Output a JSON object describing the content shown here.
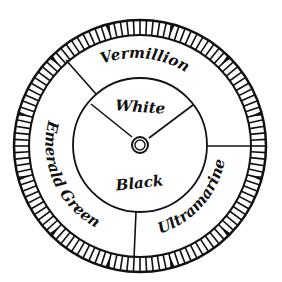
{
  "diagram": {
    "colors": {
      "ink": "#111111",
      "paper": "#ffffff"
    },
    "center": {
      "x": 140,
      "y": 145
    },
    "outer_ring": {
      "outer_radius": 126,
      "inner_radius": 111,
      "tick_count": 120
    },
    "inner_circle": {
      "radius": 67
    },
    "hub": {
      "outer_radius": 8,
      "inner_radius": 5
    },
    "outer_segments": [
      {
        "label": "Vermillion"
      },
      {
        "label": "Ultramarine"
      },
      {
        "label": "Emerald Green"
      }
    ],
    "inner_segments": [
      {
        "label": "White"
      },
      {
        "label": "Black"
      }
    ]
  }
}
